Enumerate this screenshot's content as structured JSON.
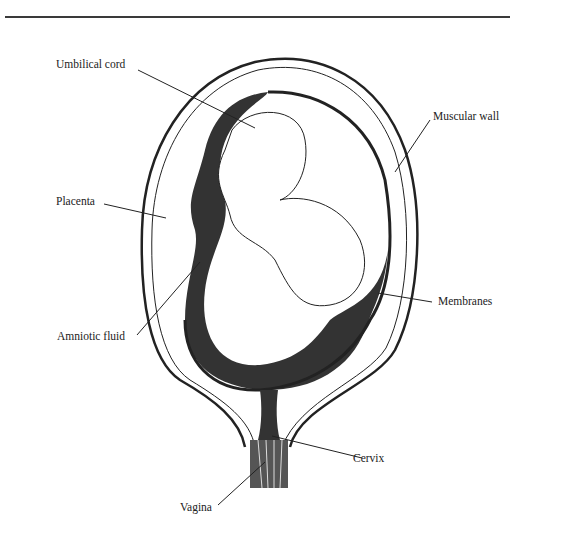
{
  "diagram": {
    "colors": {
      "ink": "#222222",
      "fluid": "#333333",
      "background": "#ffffff"
    },
    "labels": [
      {
        "id": "umbilical-cord",
        "text": "Umbilical cord"
      },
      {
        "id": "muscular-wall",
        "text": "Muscular wall"
      },
      {
        "id": "placenta",
        "text": "Placenta"
      },
      {
        "id": "membranes",
        "text": "Membranes"
      },
      {
        "id": "amniotic-fluid",
        "text": "Amniotic fluid"
      },
      {
        "id": "cervix",
        "text": "Cervix"
      },
      {
        "id": "vagina",
        "text": "Vagina"
      }
    ]
  }
}
